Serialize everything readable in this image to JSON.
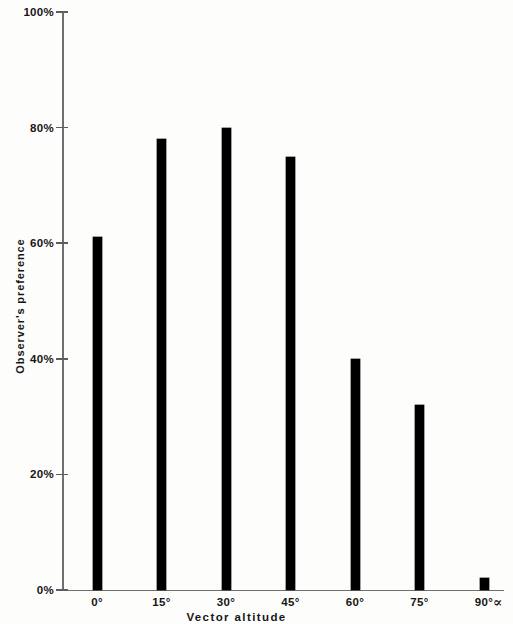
{
  "chart_data": {
    "type": "bar",
    "title": "",
    "subtitle": "",
    "xlabel": "Vector altitude",
    "ylabel": "Observer's preference",
    "categories": [
      "0°",
      "15°",
      "30°",
      "45°",
      "60°",
      "75°",
      "90°"
    ],
    "values": [
      61,
      78,
      80,
      75,
      40,
      32,
      2
    ],
    "x_tick_labels": [
      "0°",
      "15°",
      "30°",
      "45°",
      "60°",
      "75°",
      "90°"
    ],
    "y_tick_labels": [
      "100%",
      "80%",
      "60%",
      "40%",
      "20%",
      "0%"
    ],
    "y_tick_values": [
      100,
      80,
      60,
      40,
      20,
      0
    ],
    "ylim": [
      0,
      100
    ],
    "grid": false,
    "legend": null,
    "legend_position": "none",
    "bar_color": "#000000",
    "axis_color": "#6f6f6d",
    "background_color": "#fdfdfc",
    "x_axis_variable_symbol": "∝",
    "annotations": []
  },
  "axes": {
    "y_title": "Observer's preference",
    "x_title": "Vector altitude",
    "alpha_symbol": "∝"
  }
}
